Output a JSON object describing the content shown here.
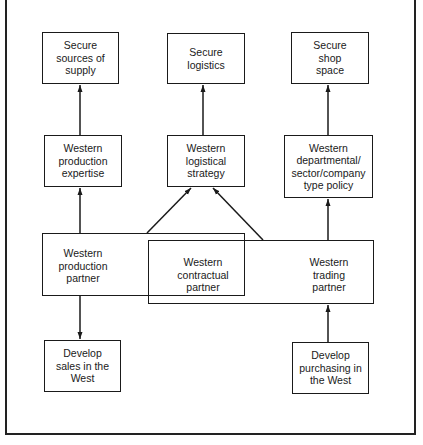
{
  "diagram": {
    "top_row": [
      {
        "id": "secure-supply",
        "lines": [
          "Secure",
          "sources of",
          "supply"
        ]
      },
      {
        "id": "secure-logistics",
        "lines": [
          "Secure",
          "logistics"
        ]
      },
      {
        "id": "secure-shop-space",
        "lines": [
          "Secure",
          "shop",
          "space"
        ]
      }
    ],
    "middle_row": [
      {
        "id": "production-expertise",
        "lines": [
          "Western",
          "production",
          "expertise"
        ]
      },
      {
        "id": "logistical-strategy",
        "lines": [
          "Western",
          "logistical",
          "strategy"
        ]
      },
      {
        "id": "departmental-policy",
        "lines": [
          "Western",
          "departmental/",
          "sector/company",
          "type policy"
        ]
      }
    ],
    "partners": [
      {
        "id": "production-partner",
        "lines": [
          "Western",
          "production",
          "partner"
        ]
      },
      {
        "id": "contractual-partner",
        "lines": [
          "Western",
          "contractual",
          "partner"
        ]
      },
      {
        "id": "trading-partner",
        "lines": [
          "Western",
          "trading",
          "partner"
        ]
      }
    ],
    "bottom_row": [
      {
        "id": "develop-sales",
        "lines": [
          "Develop",
          "sales in the",
          "West"
        ]
      },
      {
        "id": "develop-purchasing",
        "lines": [
          "Develop",
          "purchasing in",
          "the West"
        ]
      }
    ],
    "edges": [
      {
        "from": "production-expertise",
        "to": "secure-supply"
      },
      {
        "from": "logistical-strategy",
        "to": "secure-logistics"
      },
      {
        "from": "departmental-policy",
        "to": "secure-shop-space"
      },
      {
        "from": "production-partner",
        "to": "production-expertise"
      },
      {
        "from": "production-partner",
        "to": "logistical-strategy"
      },
      {
        "from": "trading-partner",
        "to": "logistical-strategy"
      },
      {
        "from": "trading-partner",
        "to": "departmental-policy"
      },
      {
        "from": "production-partner",
        "to": "develop-sales"
      },
      {
        "from": "develop-purchasing",
        "to": "trading-partner"
      }
    ]
  }
}
